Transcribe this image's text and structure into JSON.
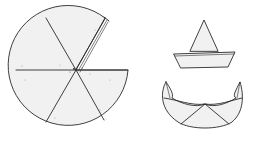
{
  "figure": {
    "description": "Line illustration of folding a paper circle into a cone hat and a crown-like folded shape",
    "colors": {
      "ink": "#2a2a2a",
      "paper": "#ffffff",
      "stipple": "#f1f1f1"
    },
    "elements": [
      {
        "id": "folded-circle",
        "label": "Circle divided into six sectors with one sector folded back"
      },
      {
        "id": "cone-hat",
        "label": "Paper cone hat with brim"
      },
      {
        "id": "folded-crown",
        "label": "Folded crescent crown shape with two horns"
      }
    ]
  }
}
